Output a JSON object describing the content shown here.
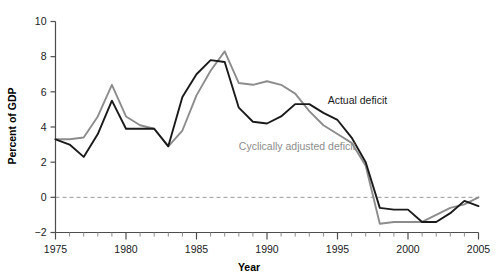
{
  "chart_data": {
    "type": "line",
    "title": "",
    "xlabel": "Year",
    "ylabel": "Percent of GDP",
    "xlim": [
      1975,
      2005
    ],
    "ylim": [
      -2,
      10
    ],
    "ytick_labels": [
      "10",
      "8",
      "6",
      "4",
      "2",
      "0",
      "-2"
    ],
    "ytick_values": [
      10,
      8,
      6,
      4,
      2,
      0,
      -2
    ],
    "xtick_labels": [
      "1975",
      "1980",
      "1985",
      "1990",
      "1995",
      "2000",
      "2005"
    ],
    "xtick_values": [
      1975,
      1980,
      1985,
      1990,
      1995,
      2000,
      2005
    ],
    "minor_xticks": true,
    "grid": false,
    "zero_line": true,
    "legend_position": "inline-annotation",
    "x": [
      1975,
      1976,
      1977,
      1978,
      1979,
      1980,
      1981,
      1982,
      1983,
      1984,
      1985,
      1986,
      1987,
      1988,
      1989,
      1990,
      1991,
      1992,
      1993,
      1994,
      1995,
      1996,
      1997,
      1998,
      1999,
      2000,
      2001,
      2002,
      2003,
      2004,
      2005
    ],
    "series": [
      {
        "name": "Actual deficit",
        "color": "#1a1a1a",
        "label": "Actual deficit",
        "values": [
          3.3,
          3.0,
          2.3,
          3.6,
          5.5,
          3.9,
          3.9,
          3.9,
          2.9,
          5.7,
          7.0,
          7.8,
          7.7,
          5.1,
          4.3,
          4.2,
          4.6,
          5.3,
          5.3,
          4.8,
          4.4,
          3.4,
          2.0,
          -0.6,
          -0.7,
          -0.7,
          -1.4,
          -1.4,
          -0.9,
          -0.2,
          -0.5
        ]
      },
      {
        "name": "Cyclically adjusted deficit",
        "color": "#8c8c8c",
        "label": "Cyclically adjusted deficit",
        "values": [
          3.3,
          3.3,
          3.4,
          4.6,
          6.4,
          4.6,
          4.1,
          3.9,
          2.9,
          3.8,
          5.8,
          7.2,
          8.3,
          6.5,
          6.4,
          6.6,
          6.4,
          5.9,
          4.9,
          4.1,
          3.6,
          3.1,
          1.8,
          -1.5,
          -1.4,
          -1.4,
          -1.4,
          -1.0,
          -0.6,
          -0.4,
          0.0
        ]
      }
    ],
    "annotations": [
      {
        "text": "Actual deficit",
        "x": 1994.3,
        "y": 5.3,
        "color": "#1a1a1a",
        "anchor": "start"
      },
      {
        "text": "Cyclically adjusted deficit",
        "x": 1988.0,
        "y": 2.7,
        "color": "#8c8c8c",
        "anchor": "start"
      }
    ]
  },
  "axis": {
    "x_title": "Year",
    "y_title": "Percent of GDP"
  }
}
